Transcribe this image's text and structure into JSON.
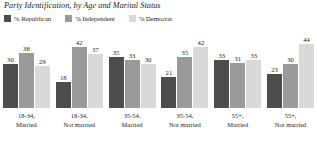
{
  "chart_data": {
    "type": "bar",
    "title": "Party Identification, by Age and Marital Status",
    "xlabel": "",
    "ylabel": "",
    "ylim": [
      0,
      50
    ],
    "grid": false,
    "legend_position": "top-left",
    "categories": [
      "18-34, Married",
      "18-34, Not married",
      "35-54, Married",
      "35-54, Not married",
      "55+, Married",
      "55+, Not married"
    ],
    "category_lines": [
      [
        "18-34,",
        "Married"
      ],
      [
        "18-34,",
        "Not married"
      ],
      [
        "35-54,",
        "Married"
      ],
      [
        "35-54,",
        "Not married"
      ],
      [
        "55+,",
        "Married"
      ],
      [
        "55+,",
        "Not married"
      ]
    ],
    "series": [
      {
        "name": "% Republican",
        "color": "#4d4d4d",
        "values": [
          30,
          18,
          35,
          21,
          33,
          23
        ]
      },
      {
        "name": "% Independent",
        "color": "#9a9a9a",
        "values": [
          38,
          42,
          33,
          35,
          31,
          30
        ]
      },
      {
        "name": "% Democrat",
        "color": "#d9d9d9",
        "values": [
          29,
          37,
          30,
          42,
          33,
          44
        ]
      }
    ]
  },
  "legend": {
    "items": [
      {
        "label": "% Republican",
        "color": "#4d4d4d"
      },
      {
        "label": "% Independent",
        "color": "#9a9a9a"
      },
      {
        "label": "% Democrat",
        "color": "#d9d9d9"
      }
    ]
  }
}
